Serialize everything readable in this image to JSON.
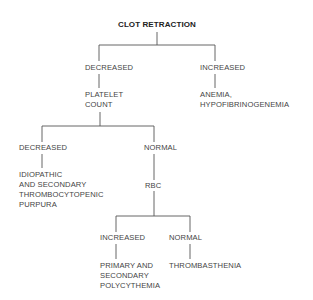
{
  "diagram": {
    "title": "CLOT RETRACTION",
    "level1": {
      "decreased": "DECREASED",
      "increased": "INCREASED",
      "increased_result": [
        "ANEMIA,",
        "HYPOFIBRINOGENEMIA"
      ]
    },
    "platelet_count": [
      "PLATELET",
      "COUNT"
    ],
    "level2": {
      "decreased": "DECREASED",
      "normal": "NORMAL",
      "decreased_result": [
        "IDIOPATHIC",
        "AND SECONDARY",
        "THROMBOCYTOPENIC",
        "PURPURA"
      ]
    },
    "rbc": "RBC",
    "level3": {
      "increased": "INCREASED",
      "normal": "NORMAL",
      "increased_result": [
        "PRIMARY AND",
        "SECONDARY",
        "POLYCYTHEMIA"
      ],
      "normal_result": "THROMBASTHENIA"
    },
    "colors": {
      "line": "#555555",
      "text": "#444444",
      "background": "#ffffff"
    }
  }
}
